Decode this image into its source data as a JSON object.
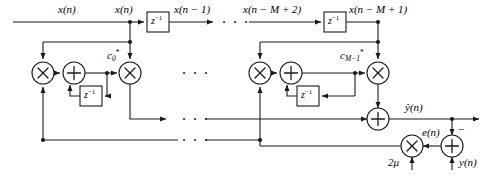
{
  "figure": {
    "type": "block-diagram",
    "background_color": "#ffffff",
    "line_color": "#1a1a1a"
  },
  "labels": {
    "x_n_left": "x(n)",
    "x_n_tap": "x(n)",
    "x_n_minus_1": "x(n − 1)",
    "x_n_minus_M_plus_2": "x(n − M + 2)",
    "x_n_minus_M_plus_1": "x(n − M + 1)",
    "delay_block": "z",
    "delay_exponent": "−1",
    "coeff_first_base": "c",
    "coeff_first_sub": "0",
    "coeff_first_star": "*",
    "coeff_last_base": "c",
    "coeff_last_sub": "M−1",
    "coeff_last_star": "*",
    "y_hat": "ŷ(n)",
    "error": "e(n)",
    "step_size": "2μ",
    "desired": "y(n)",
    "minus_sign": "−",
    "ellipsis": "· · ·"
  },
  "operators": {
    "multiply": "×",
    "add": "+"
  },
  "nodes": [
    {
      "name": "delay-block-first",
      "kind": "delay",
      "label": "z^-1",
      "x": 147,
      "y": 12,
      "w": 22,
      "h": 20
    },
    {
      "name": "delay-block-last",
      "kind": "delay",
      "label": "z^-1",
      "x": 324,
      "y": 12,
      "w": 22,
      "h": 20
    },
    {
      "name": "multiplier-error-first",
      "kind": "multiply",
      "cx": 43,
      "cy": 73,
      "r": 11
    },
    {
      "name": "accumulator-adder-first",
      "kind": "add",
      "cx": 74,
      "cy": 73,
      "r": 11
    },
    {
      "name": "coefficient-delay-first",
      "kind": "delay",
      "label": "z^-1",
      "x": 80,
      "y": 86,
      "w": 22,
      "h": 20
    },
    {
      "name": "multiplier-tap-first",
      "kind": "multiply",
      "cx": 130,
      "cy": 73,
      "r": 11
    },
    {
      "name": "multiplier-error-last",
      "kind": "multiply",
      "cx": 260,
      "cy": 73,
      "r": 11
    },
    {
      "name": "accumulator-adder-last",
      "kind": "add",
      "cx": 291,
      "cy": 73,
      "r": 11
    },
    {
      "name": "coefficient-delay-last",
      "kind": "delay",
      "label": "z^-1",
      "x": 297,
      "y": 86,
      "w": 22,
      "h": 20
    },
    {
      "name": "multiplier-tap-last",
      "kind": "multiply",
      "cx": 378,
      "cy": 73,
      "r": 11
    },
    {
      "name": "output-summing-adder",
      "kind": "add",
      "cx": 378,
      "cy": 119,
      "r": 11
    },
    {
      "name": "multiplier-step-size",
      "kind": "multiply",
      "cx": 412,
      "cy": 146,
      "r": 11
    },
    {
      "name": "error-adder",
      "kind": "add",
      "cx": 452,
      "cy": 146,
      "r": 11
    }
  ],
  "ellipses": [
    {
      "name": "ellipsis-tap-line",
      "x": 190,
      "y": 19
    },
    {
      "name": "ellipsis-mid-row",
      "x": 190,
      "y": 70
    },
    {
      "name": "ellipsis-output-row",
      "x": 190,
      "y": 110
    },
    {
      "name": "ellipsis-error-row",
      "x": 190,
      "y": 133
    }
  ]
}
